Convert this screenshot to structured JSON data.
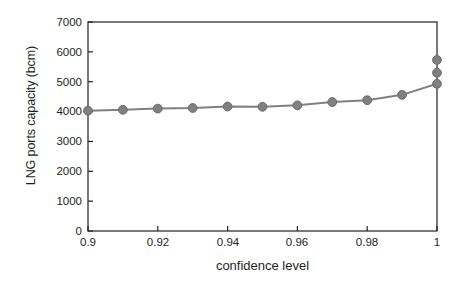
{
  "chart_data": {
    "type": "line",
    "title": "",
    "xlabel": "confidence level",
    "ylabel": "LNG ports capacity (bcm)",
    "xlim": [
      0.9,
      1.0
    ],
    "ylim": [
      0,
      7000
    ],
    "grid": false,
    "legend": false,
    "xticks": [
      "0.9",
      "0.92",
      "0.94",
      "0.96",
      "0.98",
      "1"
    ],
    "xtick_values": [
      0.9,
      0.92,
      0.94,
      0.96,
      0.98,
      1.0
    ],
    "yticks": [
      "0",
      "1000",
      "2000",
      "3000",
      "4000",
      "5000",
      "6000",
      "7000"
    ],
    "ytick_values": [
      0,
      1000,
      2000,
      3000,
      4000,
      5000,
      6000,
      7000
    ],
    "series": [
      {
        "name": "LNG ports capacity",
        "marker": "circle",
        "color": "#808080",
        "x": [
          0.9,
          0.91,
          0.92,
          0.93,
          0.94,
          0.95,
          0.96,
          0.97,
          0.98,
          0.99,
          1.0
        ],
        "values": [
          4030,
          4060,
          4100,
          4120,
          4170,
          4160,
          4210,
          4320,
          4380,
          4560,
          4930
        ]
      },
      {
        "name": "extra points at confidence level 1",
        "marker": "circle",
        "color": "#808080",
        "line": false,
        "x": [
          1.0,
          1.0
        ],
        "values": [
          5300,
          5730
        ]
      }
    ]
  },
  "axes": {
    "x_title": "confidence level",
    "y_title": "LNG ports capacity (bcm)"
  }
}
